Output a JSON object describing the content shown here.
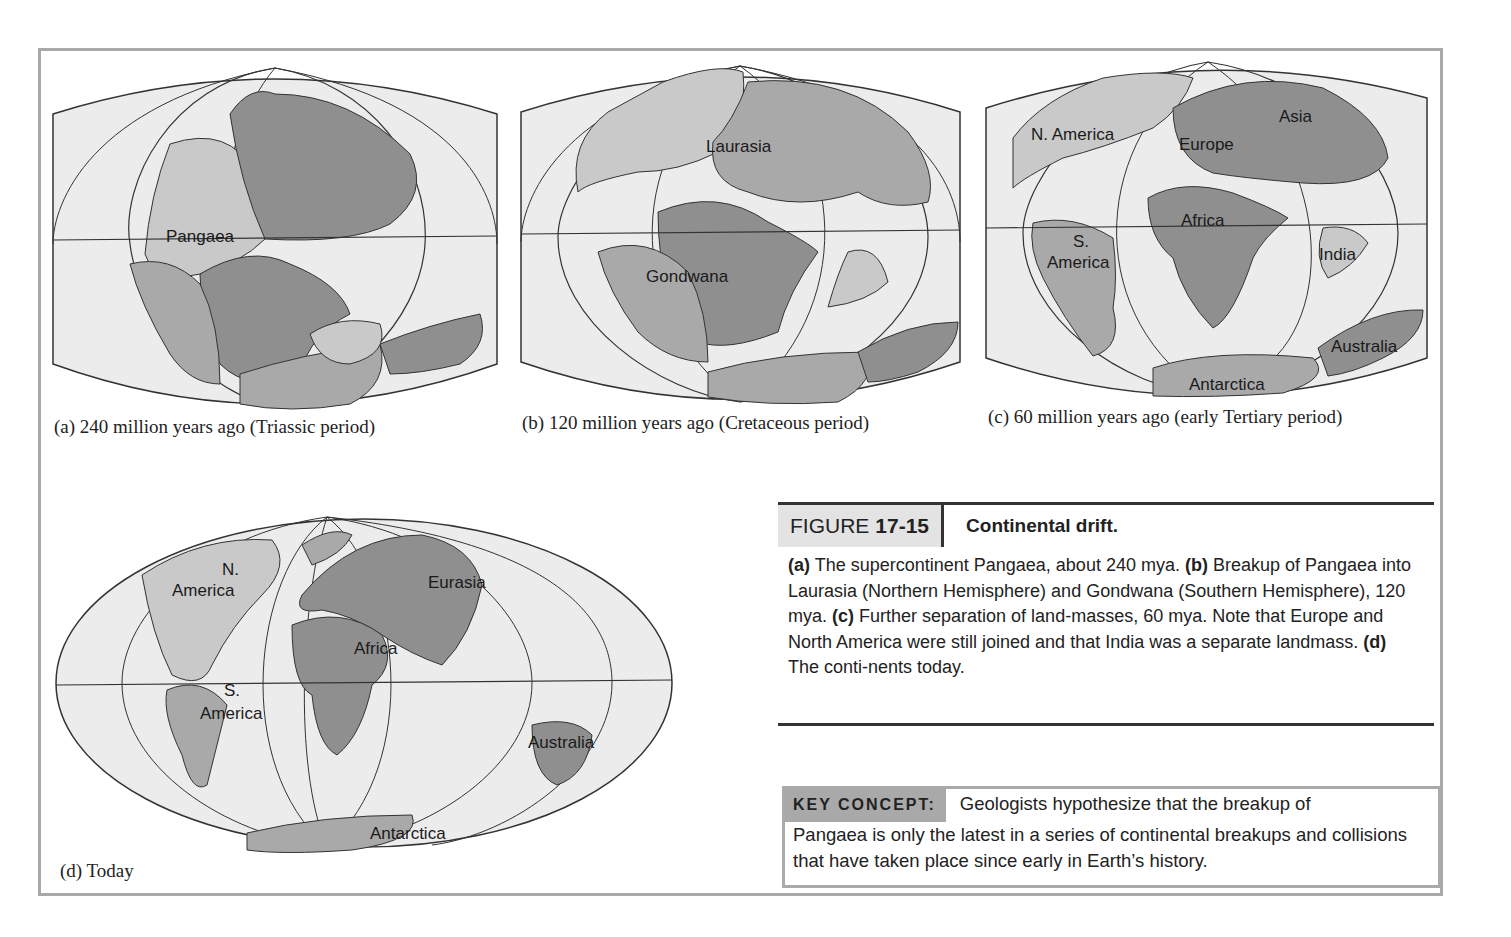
{
  "panels": [
    {
      "id": "a",
      "caption": "(a)  240 million years ago (Triassic period)",
      "labels": [
        {
          "text": "Pangaea",
          "x": 128,
          "y": 196
        }
      ]
    },
    {
      "id": "b",
      "caption": "(b)  120 million years ago (Cretaceous period)",
      "labels": [
        {
          "text": "Laurasia",
          "x": 188,
          "y": 92
        },
        {
          "text": "Gondwana",
          "x": 126,
          "y": 222
        }
      ]
    },
    {
      "id": "c",
      "caption": "(c)  60 million years ago (early Tertiary period)",
      "labels": [
        {
          "text": "N. America",
          "x": 50,
          "y": 80
        },
        {
          "text": "Europe",
          "x": 196,
          "y": 90
        },
        {
          "text": "Asia",
          "x": 298,
          "y": 62
        },
        {
          "text": "Africa",
          "x": 198,
          "y": 166
        },
        {
          "text": "S.",
          "x": 92,
          "y": 187
        },
        {
          "text": "America",
          "x": 64,
          "y": 208
        },
        {
          "text": "India",
          "x": 336,
          "y": 200
        },
        {
          "text": "Australia",
          "x": 348,
          "y": 292
        },
        {
          "text": "Antarctica",
          "x": 206,
          "y": 330
        }
      ]
    },
    {
      "id": "d",
      "caption": "(d)  Today",
      "labels": [
        {
          "text": "N.",
          "x": 220,
          "y": 61
        },
        {
          "text": "America",
          "x": 130,
          "y": 85
        },
        {
          "text": "Eurasia",
          "x": 386,
          "y": 75
        },
        {
          "text": "Africa",
          "x": 312,
          "y": 140
        },
        {
          "text": "S.",
          "x": 176,
          "y": 205
        },
        {
          "text": "America",
          "x": 158,
          "y": 205
        },
        {
          "text": "Australia",
          "x": 486,
          "y": 234
        },
        {
          "text": "Antarctica",
          "x": 330,
          "y": 326
        }
      ]
    }
  ],
  "figure": {
    "prefix": "FIGURE",
    "number": "17-15",
    "title": "Continental drift.",
    "body": [
      {
        "b": "(a)",
        "t": " The supercontinent Pangaea, about 240 mya. "
      },
      {
        "b": "(b)",
        "t": " Breakup of Pangaea into Laurasia (Northern Hemisphere) and Gondwana (Southern Hemisphere), 120 mya. "
      },
      {
        "b": "(c)",
        "t": " Further separation of land-masses, 60 mya. Note that Europe and North America were still joined and that India was a separate landmass. "
      },
      {
        "b": "(d)",
        "t": " The conti-nents today."
      }
    ]
  },
  "key_concept": {
    "label": "KEY CONCEPT:",
    "line1": "Geologists hypothesize that the breakup of",
    "rest": "Pangaea is only the latest in a series of continental breakups and collisions that have taken place since early in Earth’s history."
  },
  "colors": {
    "ocean": "#ececec",
    "land_light": "#c9c9c9",
    "land_mid": "#a9a9a9",
    "land_dark": "#8f8f8f",
    "frame": "#a9a9a9"
  }
}
